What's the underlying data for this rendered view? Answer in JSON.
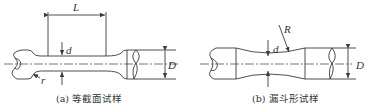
{
  "figure": {
    "panels": [
      {
        "id": "a",
        "caption": "(a) 等截面试样",
        "labels": {
          "length": "L",
          "small_diameter": "d",
          "large_diameter": "D",
          "fillet_radius": "r"
        }
      },
      {
        "id": "b",
        "caption": "(b) 漏斗形试样",
        "labels": {
          "profile_radius": "R",
          "small_diameter": "d",
          "large_diameter": "D"
        }
      }
    ],
    "line_color": "#3a3a3a",
    "background": "#ffffff"
  }
}
